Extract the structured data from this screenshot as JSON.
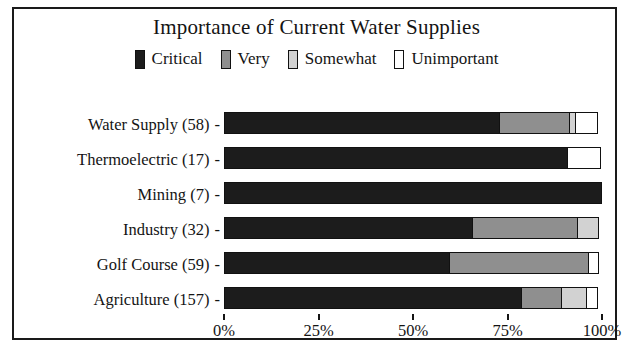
{
  "chart": {
    "title": "Importance of Current Water Supplies"
  },
  "legend": {
    "position": "top-center",
    "items": [
      {
        "label": "Critical",
        "color": "#1c1c1c",
        "swatch": "filled-black-square-icon"
      },
      {
        "label": "Very",
        "color": "#8f8f8f",
        "swatch": "filled-gray-square-icon"
      },
      {
        "label": "Somewhat",
        "color": "#d2d2d2",
        "swatch": "filled-lightgray-square-icon"
      },
      {
        "label": "Unimportant",
        "color": "#ffffff",
        "swatch": "hollow-white-square-icon"
      }
    ]
  },
  "yaxis": {
    "tick_dash": "-",
    "categories": [
      "Water Supply (58)",
      "Thermoelectric (17)",
      "Mining (7)",
      "Industry (32)",
      "Golf Course (59)",
      "Agriculture (157)"
    ]
  },
  "xaxis": {
    "ticks": [
      "0%",
      "25%",
      "50%",
      "75%",
      "100%"
    ],
    "tick_values": [
      0,
      25,
      50,
      75,
      100
    ]
  },
  "chart_data": {
    "type": "bar",
    "orientation": "horizontal",
    "stacked": true,
    "normalized_percent": true,
    "title": "Importance of Current Water Supplies",
    "xlabel": "",
    "ylabel": "",
    "xlim": [
      0,
      100
    ],
    "grid": false,
    "legend_position": "top-center",
    "categories": [
      "Water Supply (58)",
      "Thermoelectric (17)",
      "Mining (7)",
      "Industry (32)",
      "Golf Course (59)",
      "Agriculture (157)"
    ],
    "category_counts": [
      58,
      17,
      7,
      32,
      59,
      157
    ],
    "xtick_labels": [
      "0%",
      "25%",
      "50%",
      "75%",
      "100%"
    ],
    "series": [
      {
        "name": "Critical",
        "color": "#1c1c1c",
        "values": [
          73,
          91,
          100,
          66,
          60,
          79
        ]
      },
      {
        "name": "Very",
        "color": "#8f8f8f",
        "values": [
          19,
          0,
          0,
          28,
          37,
          11
        ]
      },
      {
        "name": "Somewhat",
        "color": "#d2d2d2",
        "values": [
          2,
          0,
          0,
          6,
          0,
          7
        ]
      },
      {
        "name": "Unimportant",
        "color": "#ffffff",
        "values": [
          6,
          9,
          0,
          0,
          3,
          3
        ]
      }
    ],
    "rows": [
      {
        "category": "Water Supply (58)",
        "Critical": 73,
        "Very": 19,
        "Somewhat": 2,
        "Unimportant": 6
      },
      {
        "category": "Thermoelectric (17)",
        "Critical": 91,
        "Very": 0,
        "Somewhat": 0,
        "Unimportant": 9
      },
      {
        "category": "Mining (7)",
        "Critical": 100,
        "Very": 0,
        "Somewhat": 0,
        "Unimportant": 0
      },
      {
        "category": "Industry (32)",
        "Critical": 66,
        "Very": 28,
        "Somewhat": 6,
        "Unimportant": 0
      },
      {
        "category": "Golf Course (59)",
        "Critical": 60,
        "Very": 37,
        "Somewhat": 0,
        "Unimportant": 3
      },
      {
        "category": "Agriculture (157)",
        "Critical": 79,
        "Very": 11,
        "Somewhat": 7,
        "Unimportant": 3
      }
    ]
  }
}
